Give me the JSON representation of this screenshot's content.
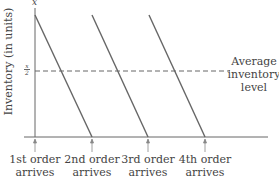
{
  "diagram": {
    "type": "inventory-sawtooth",
    "y_axis": {
      "label": "Inventory (in units)",
      "max_label": "x",
      "mid_label_num": "x",
      "mid_label_den": "2"
    },
    "average_line": {
      "label_line1": "Average",
      "label_line2": "inventory",
      "label_line3": "level"
    },
    "orders": [
      {
        "line1": "1st order",
        "line2": "arrives"
      },
      {
        "line1": "2nd order",
        "line2": "arrives"
      },
      {
        "line1": "3rd order",
        "line2": "arrives"
      },
      {
        "line1": "4th order",
        "line2": "arrives"
      }
    ],
    "colors": {
      "line": "#666666",
      "axis": "#555555",
      "text": "#444444"
    }
  }
}
